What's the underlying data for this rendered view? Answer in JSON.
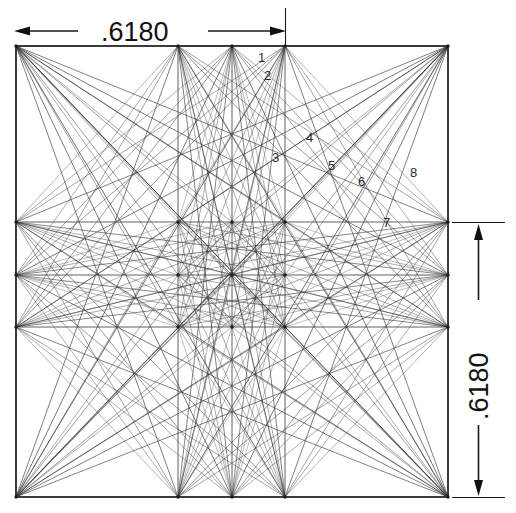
{
  "figure": {
    "title_top_dimension": ".6180",
    "title_right_dimension": ".6180",
    "background_color": "#ffffff",
    "line_color": "#333333",
    "border_color": "#1a1a1a",
    "label_color": "#2b2b2b"
  },
  "dimensions": {
    "top": {
      "value": ".6180",
      "orientation": "horizontal",
      "arrow_left": "arrow-left",
      "arrow_right": "arrow-right"
    },
    "right": {
      "value": ".6180",
      "orientation": "vertical",
      "arrow_top": "arrow-up",
      "arrow_bottom": "arrow-down"
    }
  },
  "point_labels": [
    {
      "text": "1",
      "x": 258,
      "y": 62
    },
    {
      "text": "2",
      "x": 264,
      "y": 80
    },
    {
      "text": "3",
      "x": 272,
      "y": 162
    },
    {
      "text": "4",
      "x": 306,
      "y": 142
    },
    {
      "text": "5",
      "x": 328,
      "y": 170
    },
    {
      "text": "6",
      "x": 358,
      "y": 186
    },
    {
      "text": "7",
      "x": 383,
      "y": 227
    },
    {
      "text": "8",
      "x": 410,
      "y": 177
    }
  ],
  "chart_data": {
    "type": "scatter",
    "xlabel": "",
    "ylabel": "",
    "xlim": [
      16,
      448
    ],
    "ylim": [
      46,
      497
    ],
    "grid": true,
    "square": {
      "left": 16,
      "top": 46,
      "right": 448,
      "bottom": 497
    },
    "grid_x": [
      16,
      178,
      232,
      285,
      448
    ],
    "grid_y": [
      46,
      222,
      275,
      327,
      497
    ],
    "interior_vertical_lines_x": [
      178,
      232,
      285
    ],
    "interior_horizontal_lines_y": [
      222,
      275,
      327
    ],
    "nodes_top_edge_x": [
      16,
      178,
      232,
      285,
      448
    ],
    "nodes_bottom_edge_x": [
      16,
      178,
      232,
      285,
      448
    ],
    "nodes_left_edge_y": [
      46,
      222,
      275,
      327,
      497
    ],
    "nodes_right_edge_y": [
      46,
      222,
      275,
      327,
      497
    ],
    "ratio_value": 0.618
  }
}
